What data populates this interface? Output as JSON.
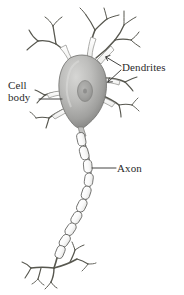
{
  "figure": {
    "background_color": "#ffffff",
    "width": 184,
    "height": 295
  },
  "labels": {
    "cell_body_line1": "Cell",
    "cell_body_line2": "body",
    "dendrites": "Dendrites",
    "axon": "Axon"
  },
  "colors": {
    "stroke": "#5a5a58",
    "dark_stroke": "#4a4a48",
    "text": "#2b2b2b",
    "soma_light": "#cfcfcd",
    "soma_mid": "#a8a8a6",
    "soma_dark": "#7e7e7c",
    "nucleus": "#9a9a98",
    "myelin_fill": "#fbfbfb",
    "leader_line": "#3a3a38"
  },
  "parts": {
    "soma": "cell-body",
    "nucleus": "nucleus",
    "dendrites": "dendrites",
    "axon": "myelinated-axon",
    "axon_terminals": "axon-terminals"
  }
}
